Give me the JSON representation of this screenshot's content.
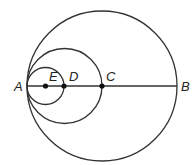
{
  "diagram": {
    "type": "concentric-tangent-circles",
    "stroke_color": "#333333",
    "point_color": "#111111",
    "segment": {
      "from": "A",
      "to": "B"
    },
    "points": [
      {
        "id": "A",
        "label": "A",
        "x": 27,
        "y": 86,
        "dot": false
      },
      {
        "id": "E",
        "label": "E",
        "x": 45.5,
        "y": 86,
        "dot": true
      },
      {
        "id": "D",
        "label": "D",
        "x": 64,
        "y": 86,
        "dot": true
      },
      {
        "id": "C",
        "label": "C",
        "x": 102,
        "y": 86,
        "dot": true
      },
      {
        "id": "B",
        "label": "B",
        "x": 177,
        "y": 86,
        "dot": false
      }
    ],
    "circles": [
      {
        "id": "large",
        "center": "C",
        "cx": 102,
        "cy": 86,
        "r": 75,
        "diameter": "AB"
      },
      {
        "id": "medium",
        "center": "D",
        "cx": 64.5,
        "cy": 86,
        "r": 37.5,
        "diameter": "AC"
      },
      {
        "id": "small",
        "center": "E",
        "cx": 45.5,
        "cy": 86,
        "r": 18.5,
        "diameter": "AD"
      }
    ],
    "labels": {
      "A": "A",
      "B": "B",
      "C": "C",
      "D": "D",
      "E": "E"
    }
  }
}
